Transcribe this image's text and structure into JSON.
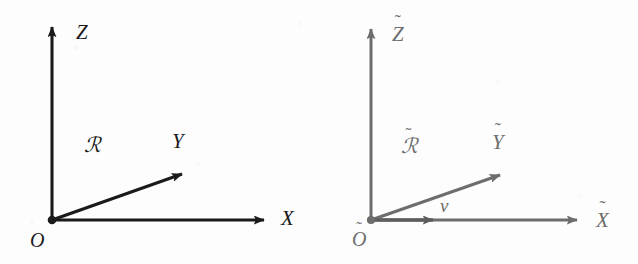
{
  "figure": {
    "kind": "vector-diagram",
    "background_color": "#fdfdfd",
    "frames": [
      {
        "id": "reference-frame-R",
        "name": "frame-R",
        "stroke_color": "#1a1a1a",
        "origin_label": "O",
        "frame_label": "ℛ",
        "frame_label_accent": "none",
        "origin_dot": true,
        "axes": [
          {
            "name": "z-axis",
            "label": "Z",
            "accent": "none",
            "direction": "up"
          },
          {
            "name": "x-axis",
            "label": "X",
            "accent": "none",
            "direction": "right"
          },
          {
            "name": "y-axis",
            "label": "Y",
            "accent": "none",
            "direction": "upper-right"
          }
        ],
        "vectors": []
      },
      {
        "id": "reference-frame-R-tilde",
        "name": "frame-R-tilde",
        "stroke_color": "#6d6d6d",
        "origin_label": "O",
        "frame_label": "ℛ",
        "frame_label_accent": "tilde",
        "origin_dot": true,
        "axes": [
          {
            "name": "z-axis",
            "label": "Z",
            "accent": "tilde",
            "direction": "up"
          },
          {
            "name": "x-axis",
            "label": "X",
            "accent": "tilde",
            "direction": "right"
          },
          {
            "name": "y-axis",
            "label": "Y",
            "accent": "tilde",
            "direction": "upper-right"
          }
        ],
        "vectors": [
          {
            "name": "vector-v",
            "label": "v",
            "accent": "none",
            "direction": "right",
            "along_axis": "x-axis"
          }
        ]
      }
    ],
    "tilde_glyph": "˜"
  }
}
